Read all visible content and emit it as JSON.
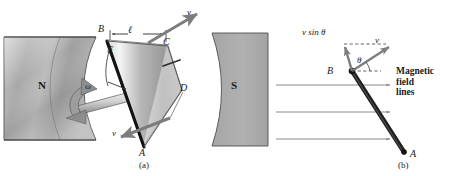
{
  "figure": {
    "type": "physics-diagram",
    "panels": [
      {
        "id": "a",
        "caption": "(a)",
        "labels": {
          "corner_B": "B",
          "corner_C": "C",
          "corner_D": "D",
          "corner_A": "A",
          "length": "ℓ",
          "velocity_top": "v",
          "velocity_bottom": "v",
          "angular_velocity": "ω",
          "angle_swept": "ωt",
          "pole_north": "N",
          "pole_south": "S"
        }
      },
      {
        "id": "b",
        "caption": "(b)",
        "labels": {
          "corner_B": "B",
          "corner_A": "A",
          "velocity": "v",
          "velocity_component": "v sin θ",
          "angle": "θ",
          "field_lines_line1": "Magnetic",
          "field_lines_line2": "field",
          "field_lines_line3": "lines"
        }
      }
    ]
  },
  "colors": {
    "magnet_fill": "#a9a9a9",
    "magnet_stroke": "#4a4a4a",
    "loop_light": "#f2f2f2",
    "loop_dark": "#8e8e8e",
    "arrow_gray": "#7d7d7d",
    "rod_black": "#1a1a1a",
    "field_line": "#8a8a8a",
    "text": "#1a1a1a"
  }
}
